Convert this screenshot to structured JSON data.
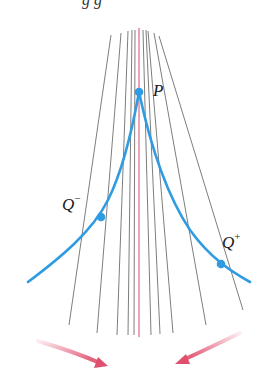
{
  "cropped_header_fragment": "g g",
  "labels": {
    "P": "P",
    "Q_minus_base": "Q",
    "Q_minus_sup": "−",
    "Q_plus_base": "Q",
    "Q_plus_sup": "+"
  },
  "colors": {
    "curve": "#2f9be0",
    "point": "#2f9be0",
    "secant_lines": "#6e6e6e",
    "tangent_line": "#d9486a",
    "arrows": "#e0506e"
  },
  "geometry": {
    "P": [
      139,
      92
    ],
    "Q_minus": [
      101,
      217
    ],
    "Q_plus": [
      221,
      264
    ]
  }
}
